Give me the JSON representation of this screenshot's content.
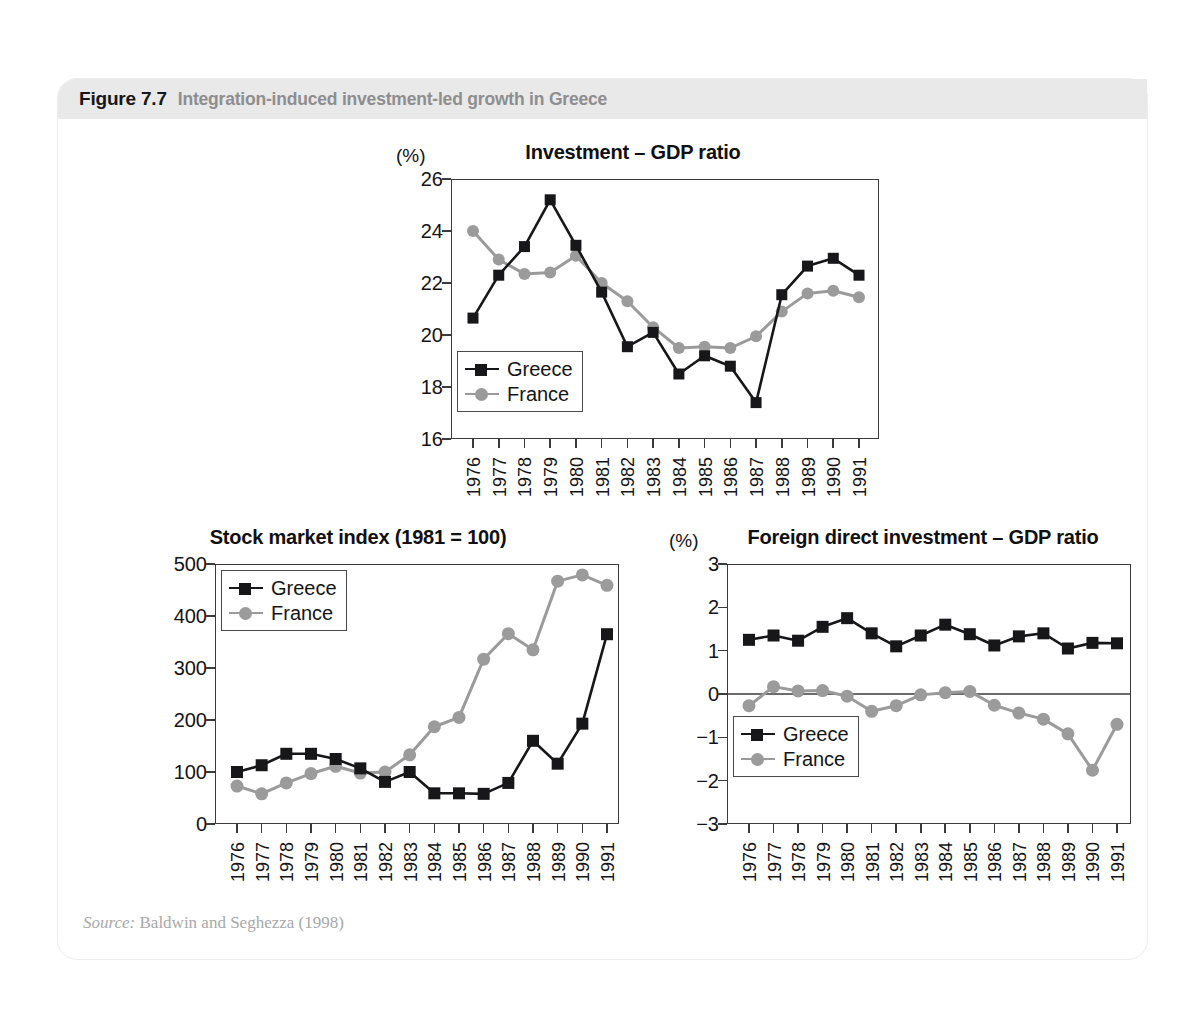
{
  "figure": {
    "number": "Figure 7.7",
    "title": "Integration-induced investment-led growth in Greece",
    "source_label": "Source:",
    "source_text": " Baldwin and Seghezza (1998)"
  },
  "colors": {
    "greece": "#17171a",
    "france": "#9b9b9b",
    "axis": "#3b3b3d",
    "header_bar": "#e9e9e9",
    "figure_number": "#17171a",
    "figure_title": "#8e8e90"
  },
  "legend": {
    "greece_label": "Greece",
    "france_label": "France"
  },
  "chart_data": [
    {
      "id": "investment-gdp-ratio",
      "type": "line",
      "title": "Investment – GDP ratio",
      "unit_label": "(%)",
      "xlabel": "",
      "ylabel": "",
      "ylim": [
        16,
        26
      ],
      "yticks": [
        16,
        18,
        20,
        22,
        24,
        26
      ],
      "ytick_labels": [
        "16",
        "18",
        "20",
        "22",
        "24",
        "26"
      ],
      "grid": false,
      "legend_position": "bottom-left",
      "categories": [
        "1976",
        "1977",
        "1978",
        "1979",
        "1980",
        "1981",
        "1982",
        "1983",
        "1984",
        "1985",
        "1986",
        "1987",
        "1988",
        "1989",
        "1990",
        "1991"
      ],
      "series": [
        {
          "name": "Greece",
          "marker": "square",
          "color": "#17171a",
          "values": [
            20.65,
            22.3,
            23.4,
            25.2,
            23.45,
            21.65,
            19.55,
            20.1,
            18.5,
            19.2,
            18.8,
            17.4,
            21.55,
            22.65,
            22.95,
            22.3
          ]
        },
        {
          "name": "France",
          "marker": "circle",
          "color": "#9b9b9b",
          "values": [
            24.0,
            22.9,
            22.35,
            22.4,
            23.05,
            22.0,
            21.3,
            20.3,
            19.5,
            19.55,
            19.5,
            19.95,
            20.9,
            21.6,
            21.7,
            21.45
          ]
        }
      ]
    },
    {
      "id": "stock-market-index",
      "type": "line",
      "title": "Stock market index (1981 = 100)",
      "unit_label": "",
      "xlabel": "",
      "ylabel": "",
      "ylim": [
        0,
        500
      ],
      "yticks": [
        0,
        100,
        200,
        300,
        400,
        500
      ],
      "ytick_labels": [
        "0",
        "100",
        "200",
        "300",
        "400",
        "500"
      ],
      "grid": false,
      "legend_position": "top-left",
      "categories": [
        "1976",
        "1977",
        "1978",
        "1979",
        "1980",
        "1981",
        "1982",
        "1983",
        "1984",
        "1985",
        "1986",
        "1987",
        "1988",
        "1989",
        "1990",
        "1991"
      ],
      "series": [
        {
          "name": "Greece",
          "marker": "square",
          "color": "#17171a",
          "values": [
            100,
            113,
            135,
            135,
            125,
            107,
            81,
            100,
            59,
            59,
            58,
            79,
            160,
            116,
            193,
            365
          ]
        },
        {
          "name": "France",
          "marker": "circle",
          "color": "#9b9b9b",
          "values": [
            73,
            58,
            79,
            97,
            111,
            98,
            100,
            133,
            187,
            205,
            317,
            366,
            335,
            467,
            479,
            459
          ]
        }
      ]
    },
    {
      "id": "fdi-gdp-ratio",
      "type": "line",
      "title": "Foreign direct investment – GDP ratio",
      "unit_label": "(%)",
      "xlabel": "",
      "ylabel": "",
      "ylim": [
        -3,
        3
      ],
      "yticks": [
        -3,
        -2,
        -1,
        0,
        1,
        2,
        3
      ],
      "ytick_labels": [
        "−3",
        "−2",
        "−1",
        "0",
        "1",
        "2",
        "3"
      ],
      "grid": false,
      "zero_line": true,
      "legend_position": "bottom-left",
      "categories": [
        "1976",
        "1977",
        "1978",
        "1979",
        "1980",
        "1981",
        "1982",
        "1983",
        "1984",
        "1985",
        "1986",
        "1987",
        "1988",
        "1989",
        "1990",
        "1991"
      ],
      "series": [
        {
          "name": "Greece",
          "marker": "square",
          "color": "#17171a",
          "values": [
            1.25,
            1.35,
            1.23,
            1.55,
            1.75,
            1.4,
            1.1,
            1.35,
            1.6,
            1.38,
            1.12,
            1.33,
            1.4,
            1.05,
            1.18,
            1.17
          ]
        },
        {
          "name": "France",
          "marker": "circle",
          "color": "#9b9b9b",
          "values": [
            -0.27,
            0.17,
            0.07,
            0.08,
            -0.05,
            -0.4,
            -0.27,
            -0.02,
            0.03,
            0.06,
            -0.26,
            -0.44,
            -0.58,
            -0.92,
            -1.76,
            -0.7
          ]
        }
      ]
    }
  ]
}
